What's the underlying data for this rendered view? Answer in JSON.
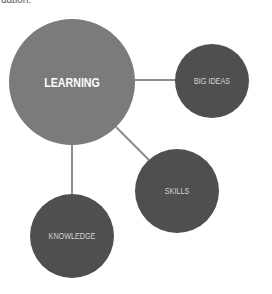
{
  "caption_fragment": "uation.",
  "colors": {
    "background": "#ffffff",
    "main_node": "#7b7b7b",
    "sub_node": "#4f4f4f",
    "connector": "#8c8c8c",
    "main_label": "#ffffff",
    "sub_label": "#d4d4d4"
  },
  "diagram": {
    "central_node": {
      "label": "LEARNING",
      "cx": 72,
      "cy": 82,
      "r": 63
    },
    "nodes": [
      {
        "label": "BIG IDEAS",
        "cx": 212,
        "cy": 81,
        "r": 37
      },
      {
        "label": "SKILLS",
        "cx": 177,
        "cy": 191,
        "r": 42
      },
      {
        "label": "KNOWLEDGE",
        "cx": 72,
        "cy": 236,
        "r": 42
      }
    ],
    "edges": [
      {
        "from": "LEARNING",
        "to": "BIG IDEAS"
      },
      {
        "from": "LEARNING",
        "to": "SKILLS"
      },
      {
        "from": "LEARNING",
        "to": "KNOWLEDGE"
      }
    ]
  }
}
